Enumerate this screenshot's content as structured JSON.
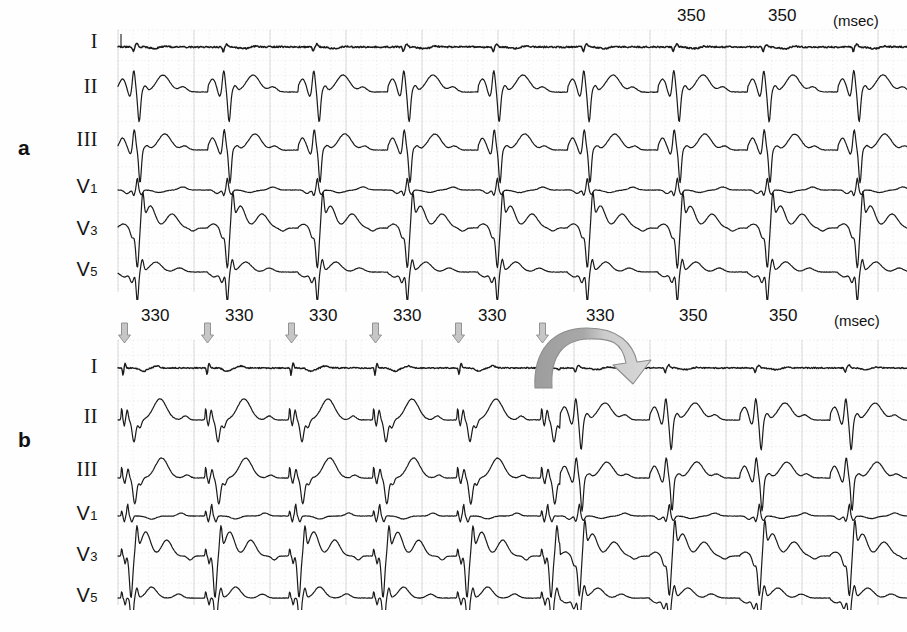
{
  "figure": {
    "caption": "",
    "unit_label": "(msec)"
  },
  "panels": [
    {
      "id": "a",
      "letter": "a",
      "leads": [
        "I",
        "II",
        "III",
        "V1",
        "V3",
        "V5"
      ],
      "lead_display": [
        {
          "main": "I",
          "sub": ""
        },
        {
          "main": "II",
          "sub": ""
        },
        {
          "main": "III",
          "sub": ""
        },
        {
          "main": "V",
          "sub": "1"
        },
        {
          "main": "V",
          "sub": "3"
        },
        {
          "main": "V",
          "sub": "5"
        }
      ],
      "intervals": [
        {
          "value": "350",
          "x": 695
        },
        {
          "value": "350",
          "x": 786
        }
      ],
      "unit_label": "(msec)",
      "unit_x": 845,
      "pacing_arrows": [],
      "beat_count": 10,
      "rhythm_note": ""
    },
    {
      "id": "b",
      "letter": "b",
      "leads": [
        "I",
        "II",
        "III",
        "V1",
        "V3",
        "V5"
      ],
      "lead_display": [
        {
          "main": "I",
          "sub": ""
        },
        {
          "main": "II",
          "sub": ""
        },
        {
          "main": "III",
          "sub": ""
        },
        {
          "main": "V",
          "sub": "1"
        },
        {
          "main": "V",
          "sub": "3"
        },
        {
          "main": "V",
          "sub": "5"
        }
      ],
      "intervals": [
        {
          "value": "330",
          "x": 159
        },
        {
          "value": "330",
          "x": 243
        },
        {
          "value": "330",
          "x": 327
        },
        {
          "value": "330",
          "x": 411
        },
        {
          "value": "330",
          "x": 496
        },
        {
          "value": "330",
          "x": 604
        },
        {
          "value": "350",
          "x": 697
        },
        {
          "value": "350",
          "x": 787
        }
      ],
      "unit_label": "(msec)",
      "unit_x": 846,
      "pacing_arrows": [
        {
          "x": 124
        },
        {
          "x": 207
        },
        {
          "x": 291
        },
        {
          "x": 375
        },
        {
          "x": 458
        },
        {
          "x": 542
        }
      ],
      "beat_count": 10,
      "rhythm_note": ""
    }
  ],
  "colors": {
    "background": "#fefefe",
    "trace": "#1a1a1a",
    "grid": "#c9c3c0",
    "arrow_fill": "#c6c6c6",
    "arrow_stroke": "#8a8a8a",
    "transition_arrow_dark": "#9a9a9a",
    "transition_arrow_light": "#d2d2d2",
    "transition_arrow_stroke": "#8c8c8c",
    "text": "#111111"
  },
  "chart_data": {
    "type": "line",
    "title": "",
    "xlabel": "",
    "ylabel": "",
    "panels": [
      {
        "panel": "a",
        "leads": [
          "I",
          "II",
          "III",
          "V1",
          "V3",
          "V5"
        ],
        "cycle_length_ms": [
          350,
          350
        ],
        "annotated_intervals_ms": [
          350,
          350
        ],
        "paced": false,
        "beats": 10,
        "beat_interval_px": 90
      },
      {
        "panel": "b",
        "leads": [
          "I",
          "II",
          "III",
          "V1",
          "V3",
          "V5"
        ],
        "cycle_length_ms": [
          330,
          330,
          330,
          330,
          330,
          330,
          350,
          350
        ],
        "annotated_intervals_ms": [
          330,
          330,
          330,
          330,
          330,
          330,
          350,
          350
        ],
        "paced": true,
        "pacing_spikes": 6,
        "beats": 10,
        "beat_interval_px": 84
      }
    ]
  }
}
